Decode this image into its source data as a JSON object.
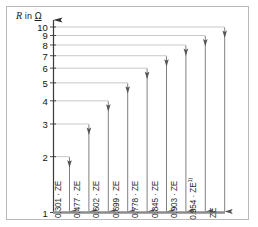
{
  "figure": {
    "axis_title_symbol": "R",
    "axis_title_rest": " in ",
    "axis_title_unit": "Ω",
    "axis_title_full": "R in Ω"
  },
  "chart_data": {
    "type": "bar",
    "title": "R in Ω",
    "xlabel": "",
    "ylabel": "R in Ω",
    "scale": "log10",
    "ylim": [
      1,
      10
    ],
    "grid": true,
    "legend": "none",
    "y_tick_labels": [
      "1",
      "2",
      "3",
      "4",
      "5",
      "6",
      "7",
      "8",
      "9",
      "10"
    ],
    "y_tick_values": [
      1,
      2,
      3,
      4,
      5,
      6,
      7,
      8,
      9,
      10
    ],
    "categories": [
      "0.301 · ZE",
      "0.477 · ZE",
      "0.602 · ZE",
      "0.699 · ZE",
      "0.778 · ZE",
      "0.845 · ZE",
      "0.903 · ZE",
      "0.954 · ZE",
      "ZE"
    ],
    "values": [
      2,
      3,
      4,
      5,
      6,
      7,
      8,
      9,
      10
    ],
    "annotations": [
      {
        "label": "0.301 · ZE",
        "top_value": 2,
        "fraction": 0.301,
        "footnote": ""
      },
      {
        "label": "0.477 · ZE",
        "top_value": 3,
        "fraction": 0.477,
        "footnote": ""
      },
      {
        "label": "0.602 · ZE",
        "top_value": 4,
        "fraction": 0.602,
        "footnote": ""
      },
      {
        "label": "0.699 · ZE",
        "top_value": 5,
        "fraction": 0.699,
        "footnote": ""
      },
      {
        "label": "0.778 · ZE",
        "top_value": 6,
        "fraction": 0.778,
        "footnote": ""
      },
      {
        "label": "0.845 · ZE",
        "top_value": 7,
        "fraction": 0.845,
        "footnote": ""
      },
      {
        "label": "0.903 · ZE",
        "top_value": 8,
        "fraction": 0.903,
        "footnote": ""
      },
      {
        "label": "0.954 · ZE",
        "top_value": 9,
        "fraction": 0.954,
        "footnote": "1)"
      },
      {
        "label": "ZE",
        "top_value": 10,
        "fraction": 1.0,
        "footnote": ""
      }
    ]
  },
  "colors": {
    "frame": "#b9b9b9",
    "axis": "#3a3a3a",
    "gridline": "#b0b0b0",
    "arrow": "#555555",
    "baseline": "#8c8c8c",
    "text": "#141414",
    "background": "#ffffff"
  }
}
